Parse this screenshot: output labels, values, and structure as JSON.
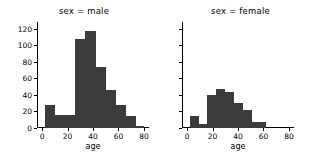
{
  "figure": {
    "background": "#ffffff",
    "bar_color": "#3b3b3b",
    "axis_color": "#000000"
  },
  "panels": [
    {
      "title": "sex = male",
      "xlabel": "age",
      "show_ytick_labels": true
    },
    {
      "title": "sex = female",
      "xlabel": "age",
      "show_ytick_labels": false
    }
  ],
  "axes": {
    "ylim": [
      0,
      128
    ],
    "yticks": [
      0,
      20,
      40,
      60,
      80,
      100,
      120
    ],
    "ytick_labels": [
      "0",
      "20",
      "40",
      "60",
      "80",
      "100",
      "120"
    ],
    "xlim": [
      -4,
      84
    ],
    "xticks": [
      0,
      20,
      40,
      60,
      80
    ],
    "xtick_labels": [
      "0",
      "20",
      "40",
      "60",
      "80"
    ],
    "grid": false
  },
  "chart_data": {
    "type": "bar",
    "title": "",
    "xlabel": "age",
    "ylabel": "",
    "xlim": [
      -4,
      84
    ],
    "ylim": [
      0,
      128
    ],
    "grid": false,
    "legend": null,
    "subplots": [
      {
        "title": "sex = male",
        "bin_edges": [
          2,
          10,
          18,
          26,
          34,
          42,
          50,
          58,
          66,
          74,
          80
        ],
        "categories": [
          "2-10",
          "10-18",
          "18-26",
          "26-34",
          "34-42",
          "42-50",
          "50-58",
          "58-66",
          "66-74",
          "74-80"
        ],
        "values": [
          28,
          16,
          16,
          108,
          117,
          74,
          46,
          28,
          14,
          3
        ]
      },
      {
        "title": "sex = female",
        "bin_edges": [
          2,
          9,
          16,
          23,
          30,
          37,
          44,
          51,
          58,
          62
        ],
        "categories": [
          "2-9",
          "9-16",
          "16-23",
          "23-30",
          "30-37",
          "37-44",
          "44-51",
          "51-58",
          "58-62"
        ],
        "values": [
          15,
          5,
          40,
          47,
          44,
          30,
          22,
          7,
          7
        ]
      }
    ]
  }
}
